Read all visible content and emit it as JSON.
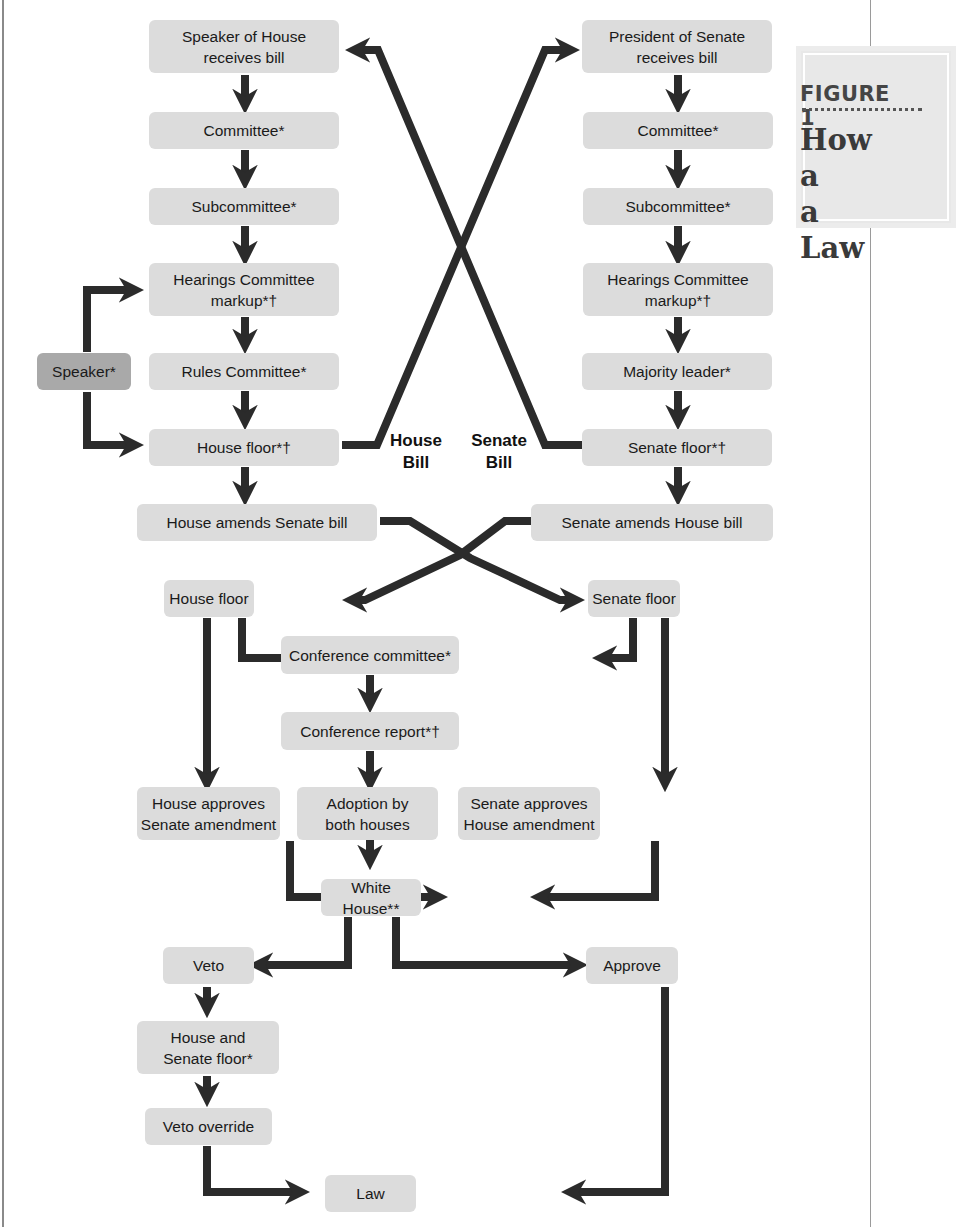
{
  "figure": {
    "label": "FIGURE 1",
    "title_line1": "How a",
    "title_line2": "a Law"
  },
  "house_column": {
    "speaker_receives": "Speaker of House\nreceives bill",
    "committee": "Committee*",
    "subcommittee": "Subcommittee*",
    "hearings": "Hearings Committee\nmarkup*†",
    "rules_committee": "Rules Committee*",
    "house_floor": "House floor*†",
    "amends_senate_bill": "House amends Senate bill",
    "speaker_side": "Speaker*"
  },
  "senate_column": {
    "president_receives": "President of Senate\nreceives bill",
    "committee": "Committee*",
    "subcommittee": "Subcommittee*",
    "hearings": "Hearings Committee\nmarkup*†",
    "majority_leader": "Majority leader*",
    "senate_floor": "Senate floor*†",
    "amends_house_bill": "Senate amends House bill"
  },
  "crossover_labels": {
    "house_bill": "House\nBill",
    "senate_bill": "Senate\nBill"
  },
  "reconciliation": {
    "house_floor": "House floor",
    "senate_floor": "Senate floor",
    "conference_committee": "Conference committee*",
    "conference_report": "Conference report*†",
    "house_approves": "House approves\nSenate amendment",
    "adoption": "Adoption by\nboth houses",
    "senate_approves": "Senate approves\nHouse amendment"
  },
  "executive": {
    "white_house": "White House**",
    "veto": "Veto",
    "approve": "Approve",
    "house_senate_floor": "House and\nSenate floor*",
    "veto_override": "Veto override",
    "law": "Law"
  },
  "colors": {
    "box_fill": "#dcdcdc",
    "speaker_box_fill": "#a9a9a9",
    "arrow": "#2b2b2b",
    "title_panel": "#e8e8e8"
  }
}
